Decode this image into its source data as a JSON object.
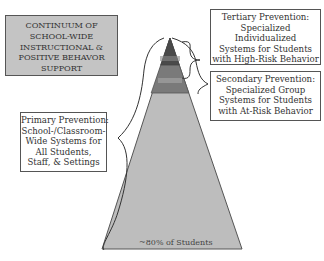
{
  "title": {
    "lines": [
      "CONTINUUM OF",
      "SCHOOL-WIDE",
      "INSTRUCTIONAL &",
      "POSITIVE BEHAVOR",
      "SUPPORT"
    ]
  },
  "tiers": {
    "tertiary": {
      "lines": [
        "Tertiary Prevention:",
        "Specialized",
        "Individualized",
        "Systems for Students",
        "with High-Risk Behavior"
      ],
      "color": "#4a4a4a"
    },
    "secondary": {
      "lines": [
        "Secondary Prevention:",
        "Specialized Group",
        "Systems for Students",
        "with At-Risk Behavior"
      ],
      "color": "#7a7a7a"
    },
    "primary": {
      "lines": [
        "Primary Prevention:",
        "School-/Classroom-",
        "Wide Systems for",
        "All Students,",
        "Staff, & Settings"
      ],
      "color": "#bdbdbd"
    }
  },
  "pyramid": {
    "base_label": "~80% of Students"
  }
}
